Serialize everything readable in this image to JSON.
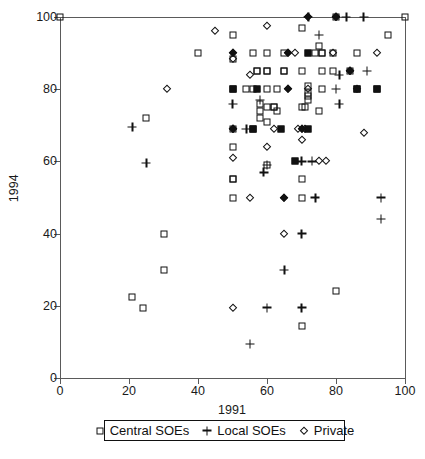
{
  "chart_data": {
    "type": "scatter",
    "title": "",
    "xlabel": "1991",
    "ylabel": "1994",
    "xlim": [
      0,
      100
    ],
    "ylim": [
      0,
      100
    ],
    "xticks": [
      0,
      20,
      40,
      60,
      80,
      100
    ],
    "yticks": [
      0,
      20,
      40,
      60,
      80,
      100
    ],
    "grid": false,
    "legend_position": "below-axes",
    "series": [
      {
        "name": "Central SOEs",
        "marker": "open-square",
        "points": [
          [
            0,
            100
          ],
          [
            100,
            100
          ],
          [
            80,
            100
          ],
          [
            50,
            95
          ],
          [
            70,
            97
          ],
          [
            95,
            95
          ],
          [
            40,
            90
          ],
          [
            56,
            90
          ],
          [
            60,
            90
          ],
          [
            50,
            88.5
          ],
          [
            65,
            90
          ],
          [
            75,
            92
          ],
          [
            76,
            90
          ],
          [
            79,
            90
          ],
          [
            86,
            90
          ],
          [
            74,
            90
          ],
          [
            57,
            85
          ],
          [
            60,
            85
          ],
          [
            65,
            85
          ],
          [
            70,
            85
          ],
          [
            76,
            85
          ],
          [
            79,
            85
          ],
          [
            84,
            85
          ],
          [
            50,
            80
          ],
          [
            54,
            80
          ],
          [
            56,
            80
          ],
          [
            60,
            80
          ],
          [
            72,
            81
          ],
          [
            72,
            79
          ],
          [
            76,
            80
          ],
          [
            86,
            80
          ],
          [
            92,
            80
          ],
          [
            58,
            76
          ],
          [
            58,
            74
          ],
          [
            60,
            75
          ],
          [
            62,
            75
          ],
          [
            63,
            74
          ],
          [
            70,
            75
          ],
          [
            71,
            75
          ],
          [
            75,
            74
          ],
          [
            58,
            72
          ],
          [
            60,
            71
          ],
          [
            25,
            72
          ],
          [
            50,
            69
          ],
          [
            56,
            69
          ],
          [
            50,
            64
          ],
          [
            30,
            40
          ],
          [
            30,
            30
          ],
          [
            21,
            22.5
          ],
          [
            24,
            19.5
          ],
          [
            50,
            55
          ],
          [
            70,
            55
          ],
          [
            50,
            50
          ],
          [
            80,
            24
          ],
          [
            70,
            14.5
          ],
          [
            72,
            78
          ],
          [
            72,
            77
          ]
        ]
      },
      {
        "name": "Local SOEs",
        "marker": "plus",
        "points": [
          [
            72,
            100
          ],
          [
            83,
            100
          ],
          [
            88,
            100
          ],
          [
            75,
            95
          ],
          [
            89,
            85
          ],
          [
            81,
            84
          ],
          [
            80,
            80
          ],
          [
            81,
            76
          ],
          [
            50,
            76
          ],
          [
            58,
            77
          ],
          [
            54,
            69
          ],
          [
            70,
            60
          ],
          [
            73,
            60
          ],
          [
            60,
            59
          ],
          [
            59,
            57
          ],
          [
            25,
            59.5
          ],
          [
            21,
            69.5
          ],
          [
            74,
            50
          ],
          [
            93,
            50
          ],
          [
            93,
            44
          ],
          [
            70,
            40
          ],
          [
            65,
            30
          ],
          [
            60,
            19.5
          ],
          [
            70,
            19.5
          ],
          [
            55,
            9.5
          ]
        ]
      },
      {
        "name": "Private",
        "marker": "open-diamond",
        "points": [
          [
            80,
            100
          ],
          [
            45,
            96
          ],
          [
            60,
            97.5
          ],
          [
            50,
            88.5
          ],
          [
            68,
            90
          ],
          [
            92,
            90
          ],
          [
            79,
            90
          ],
          [
            55,
            84
          ],
          [
            84,
            85
          ],
          [
            31,
            80
          ],
          [
            72,
            80
          ],
          [
            86,
            80
          ],
          [
            62,
            69
          ],
          [
            69,
            69
          ],
          [
            71,
            69
          ],
          [
            88,
            68
          ],
          [
            50,
            69
          ],
          [
            70,
            66
          ],
          [
            60,
            64
          ],
          [
            50,
            61
          ],
          [
            75,
            60
          ],
          [
            77,
            60
          ],
          [
            55,
            50
          ],
          [
            65,
            40
          ],
          [
            50,
            19.5
          ]
        ]
      }
    ],
    "overlap_markers": [
      {
        "x": 50,
        "y": 80,
        "style": "filled-square"
      },
      {
        "x": 57,
        "y": 80,
        "style": "filled-square"
      },
      {
        "x": 66,
        "y": 80,
        "style": "filled-diamond"
      },
      {
        "x": 50,
        "y": 90,
        "style": "filled-diamond"
      },
      {
        "x": 66,
        "y": 90,
        "style": "filled-diamond"
      },
      {
        "x": 72,
        "y": 90,
        "style": "filled-square"
      },
      {
        "x": 72,
        "y": 100,
        "style": "filled-diamond"
      },
      {
        "x": 80,
        "y": 100,
        "style": "filled-diamond"
      },
      {
        "x": 56,
        "y": 69,
        "style": "filled-square"
      },
      {
        "x": 64,
        "y": 69,
        "style": "filled-square"
      },
      {
        "x": 70,
        "y": 69,
        "style": "filled-diamond"
      },
      {
        "x": 72,
        "y": 69,
        "style": "filled-square"
      },
      {
        "x": 50,
        "y": 69,
        "style": "filled-diamond"
      },
      {
        "x": 68,
        "y": 60,
        "style": "filled-square"
      },
      {
        "x": 65,
        "y": 50,
        "style": "filled-diamond"
      },
      {
        "x": 84,
        "y": 85,
        "style": "filled-diamond"
      },
      {
        "x": 86,
        "y": 80,
        "style": "filled-square"
      },
      {
        "x": 92,
        "y": 80,
        "style": "filled-square"
      },
      {
        "x": 60,
        "y": 85,
        "style": "crosshatch-square"
      },
      {
        "x": 65,
        "y": 85,
        "style": "crosshatch-square"
      },
      {
        "x": 63,
        "y": 80,
        "style": "crosshatch-square"
      },
      {
        "x": 76,
        "y": 90,
        "style": "crosshatch-square"
      },
      {
        "x": 57,
        "y": 85,
        "style": "crosshatch-square"
      },
      {
        "x": 60,
        "y": 59,
        "style": "crosshatch-square"
      },
      {
        "x": 50,
        "y": 55,
        "style": "crosshatch-square"
      },
      {
        "x": 70,
        "y": 50,
        "style": "crosshatch-square"
      },
      {
        "x": 62,
        "y": 75,
        "style": "crosshatch-square"
      }
    ]
  },
  "axes": {
    "ylabel": "1994",
    "xlabel": "1991",
    "ytick_labels": [
      "100",
      "80",
      "60",
      "40",
      "20",
      "0"
    ],
    "xtick_labels": [
      "0",
      "20",
      "40",
      "60",
      "80",
      "100"
    ]
  },
  "legend": {
    "entries": [
      {
        "label": "Central SOEs",
        "symbol": "open-square"
      },
      {
        "label": "Local SOEs",
        "symbol": "plus"
      },
      {
        "label": "Private",
        "symbol": "open-diamond"
      }
    ]
  },
  "caption": ""
}
